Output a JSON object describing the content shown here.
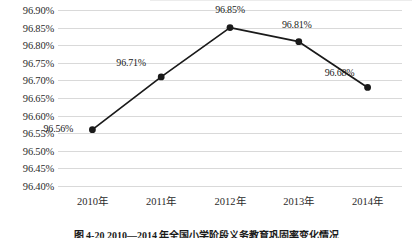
{
  "chart_data": {
    "type": "line",
    "title": "",
    "xlabel": "",
    "ylabel": "",
    "categories": [
      "2010年",
      "2011年",
      "2012年",
      "2013年",
      "2014年"
    ],
    "values": [
      96.56,
      96.71,
      96.85,
      96.81,
      96.68
    ],
    "point_labels": [
      "96.56%",
      "96.71%",
      "96.85%",
      "96.81%",
      "96.68%"
    ],
    "ylim": [
      96.4,
      96.9
    ],
    "ytick_step": 0.05,
    "ytick_labels": [
      "96.90%",
      "96.85%",
      "96.80%",
      "96.75%",
      "96.70%",
      "96.65%",
      "96.60%",
      "96.55%",
      "96.50%",
      "96.45%",
      "96.40%"
    ],
    "ytick_values": [
      96.9,
      96.85,
      96.8,
      96.75,
      96.7,
      96.65,
      96.6,
      96.55,
      96.5,
      96.45,
      96.4
    ],
    "grid": "horizontal",
    "legend": "none",
    "series_color": "#1a1a1a",
    "marker": "circle",
    "gridline_color": "#d9d9d9"
  },
  "caption": {
    "text": "图 4-20  2010—2014 年全国小学阶段义务教育巩固率变化情况"
  }
}
